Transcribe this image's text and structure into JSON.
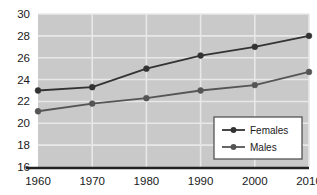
{
  "chart_data": {
    "type": "line",
    "title": "",
    "subtitle": "",
    "xlabel": "",
    "ylabel": "",
    "categories": [
      "1960",
      "1970",
      "1980",
      "1990",
      "2000",
      "2010"
    ],
    "x": [
      1960,
      1970,
      1980,
      1990,
      2000,
      2010
    ],
    "series": [
      {
        "name": "Females",
        "values": [
          23.0,
          23.3,
          25.0,
          26.2,
          27.0,
          28.0
        ]
      },
      {
        "name": "Males",
        "values": [
          21.1,
          21.8,
          22.3,
          23.0,
          23.5,
          24.7
        ]
      }
    ],
    "ylim": [
      16,
      30
    ],
    "xlim": [
      1960,
      2010
    ],
    "yticks": [
      "30",
      "28",
      "26",
      "24",
      "22",
      "20",
      "18",
      "16"
    ],
    "ytick_values": [
      30,
      28,
      26,
      24,
      22,
      20,
      18,
      16
    ],
    "xticks": [
      "1960",
      "1970",
      "1980",
      "1990",
      "2000",
      "2010"
    ],
    "grid": true,
    "grid_axis": "both",
    "legend_position": "bottom-right",
    "markers": "filled-circle",
    "colors": {
      "plot_background": "#c9c9c9",
      "grid_line": "#e8e8e8",
      "series_females": "#333333",
      "series_males": "#555555",
      "axis": "#222222",
      "legend_background": "#ffffff",
      "legend_border": "#555555",
      "page_background": "#ffffff",
      "text": "#1a1a1a"
    }
  },
  "legend": {
    "entries": [
      {
        "label": "Females",
        "marker": "filled-circle-icon"
      },
      {
        "label": "Males",
        "marker": "filled-circle-icon"
      }
    ]
  }
}
